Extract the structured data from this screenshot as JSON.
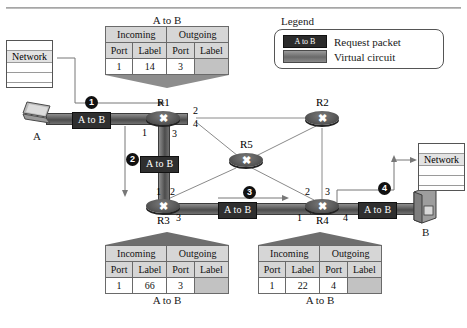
{
  "legend": {
    "title": "Legend",
    "items": [
      {
        "swatch_label": "A to B",
        "text": "Request packet",
        "color": "#2b2b2b",
        "kind": "packet"
      },
      {
        "swatch_label": "",
        "text": "Virtual circuit",
        "color": "#6a6a6a",
        "kind": "circuit"
      }
    ]
  },
  "tables": {
    "r1": {
      "caption_top": "A to B",
      "caption_bottom": "",
      "group_headers": [
        "Incoming",
        "Outgoing"
      ],
      "column_headers": [
        "Port",
        "Label",
        "Port",
        "Label"
      ],
      "row": [
        "1",
        "14",
        "3",
        ""
      ]
    },
    "r3": {
      "caption_top": "",
      "caption_bottom": "A to B",
      "group_headers": [
        "Incoming",
        "Outgoing"
      ],
      "column_headers": [
        "Port",
        "Label",
        "Port",
        "Label"
      ],
      "row": [
        "1",
        "66",
        "3",
        ""
      ]
    },
    "r4": {
      "caption_top": "",
      "caption_bottom": "A to B",
      "group_headers": [
        "Incoming",
        "Outgoing"
      ],
      "column_headers": [
        "Port",
        "Label",
        "Port",
        "Label"
      ],
      "row": [
        "1",
        "22",
        "4",
        ""
      ]
    }
  },
  "routers": {
    "r1": {
      "label": "R1",
      "ports": [
        "1",
        "2",
        "3",
        "4"
      ]
    },
    "r2": {
      "label": "R2",
      "ports": []
    },
    "r3": {
      "label": "R3",
      "ports": [
        "1",
        "2",
        "3"
      ]
    },
    "r4": {
      "label": "R4",
      "ports": [
        "1",
        "2",
        "3",
        "4"
      ]
    },
    "r5": {
      "label": "R5",
      "ports": []
    }
  },
  "hosts": {
    "a": {
      "label": "A"
    },
    "b": {
      "label": "B"
    }
  },
  "networks": {
    "left": {
      "label": "Network"
    },
    "right": {
      "label": "Network"
    }
  },
  "packets": {
    "hop1": "A to B",
    "hop2": "A to B",
    "hop3": "A to B",
    "hop4": "A to B"
  },
  "steps": [
    "1",
    "2",
    "3",
    "4"
  ],
  "colors": {
    "packet_chip": "#2f2f2f",
    "circuit": "#5a5a5a",
    "table_header": "#d6d6d6",
    "table_blank": "#c2c2c2",
    "link_thin": "#8a8a8a"
  }
}
